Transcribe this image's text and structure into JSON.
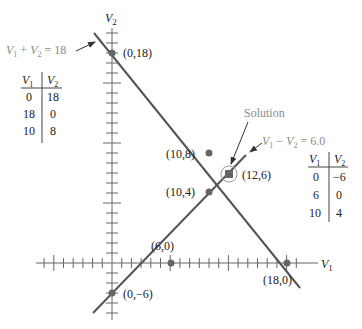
{
  "figure": {
    "axis_labels": {
      "x": "V",
      "x_sub": "1",
      "y": "V",
      "y_sub": "2"
    },
    "equations": [
      {
        "id": "eq1",
        "text_parts": [
          "V",
          "1",
          " + ",
          "V",
          "2",
          " = 18"
        ]
      },
      {
        "id": "eq2",
        "text_parts": [
          "V",
          "1",
          " − ",
          "V",
          "2",
          " = 6.0"
        ]
      }
    ],
    "solution_label": "Solution",
    "points": [
      {
        "label": "(0,18)"
      },
      {
        "label": "(18,0)"
      },
      {
        "label": "(10,8)"
      },
      {
        "label": "(12,6)"
      },
      {
        "label": "(10,4)"
      },
      {
        "label": "(6,0)"
      },
      {
        "label": "(0,−6)"
      }
    ],
    "table1": {
      "headers": [
        "V1",
        "V2"
      ],
      "rows": [
        [
          "0",
          "18"
        ],
        [
          "18",
          "0"
        ],
        [
          "10",
          "8"
        ]
      ]
    },
    "table2": {
      "headers": [
        "V1",
        "V2"
      ],
      "rows": [
        [
          "0",
          "−6"
        ],
        [
          "6",
          "0"
        ],
        [
          "10",
          "4"
        ]
      ]
    },
    "colors": {
      "line": "#555555",
      "point": "#666666",
      "label_gray": "#8a8a8a"
    }
  }
}
